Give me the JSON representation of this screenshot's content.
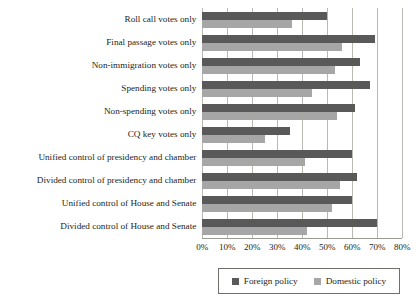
{
  "chart_data": {
    "type": "bar",
    "orientation": "horizontal",
    "title": "",
    "subtitle": "",
    "xlabel": "",
    "ylabel": "",
    "xlim": [
      0,
      80
    ],
    "xticks": [
      0,
      10,
      20,
      30,
      40,
      50,
      60,
      70,
      80
    ],
    "xticklabels": [
      "0%",
      "10%",
      "20%",
      "30%",
      "40%",
      "50%",
      "60%",
      "70%",
      "80%"
    ],
    "grid": true,
    "legend_position": "bottom",
    "categories": [
      "Roll call votes only",
      "Final passage votes only",
      "Non-immigration votes only",
      "Spending votes only",
      "Non-spending votes only",
      "CQ key votes only",
      "Unified control of presidency and chamber",
      "Divided control of presidency and chamber",
      "Unified control of House and Senate",
      "Divided control of House and Senate"
    ],
    "series": [
      {
        "name": "Foreign policy",
        "color": "#595959",
        "values": [
          50,
          69,
          63,
          67,
          61,
          35,
          60,
          62,
          60,
          70
        ]
      },
      {
        "name": "Domestic policy",
        "color": "#a6a6a6",
        "values": [
          36,
          56,
          53,
          44,
          54,
          25,
          41,
          55,
          52,
          42
        ]
      }
    ]
  },
  "legend": {
    "entries": [
      {
        "label": "Foreign policy"
      },
      {
        "label": "Domestic policy"
      }
    ]
  },
  "colors": {
    "foreign_policy": "#595959",
    "domestic_policy": "#a6a6a6",
    "gridline": "#b9b9b4",
    "text": "#231f20"
  }
}
